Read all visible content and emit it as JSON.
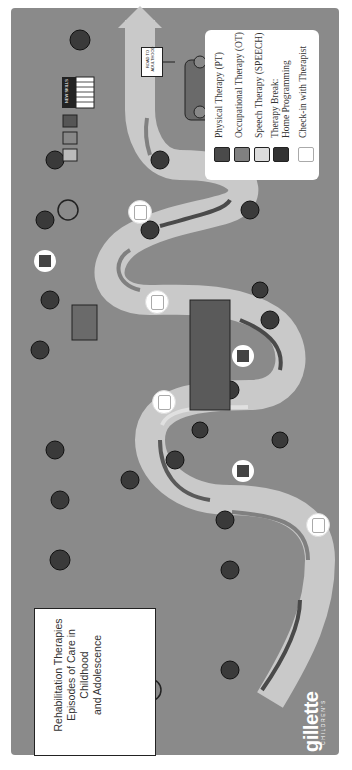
{
  "title": {
    "line1": "Rehabilitation Therapies",
    "line2": "Episodes of Care in Childhood",
    "line3": "and Adolescence"
  },
  "legend": {
    "items": [
      {
        "label": "Physical Therapy (PT)",
        "swatch": "#4a4a4a",
        "icon": "pt-square-icon"
      },
      {
        "label": "Occupational Therapy (OT)",
        "swatch": "#808080",
        "icon": "ot-square-icon"
      },
      {
        "label": "Speech Therapy (SPEECH)",
        "swatch": "#dcdcdc",
        "icon": "speech-square-icon"
      },
      {
        "label": "Therapy Break:",
        "label2": "Home Programming",
        "icon": "house-icon"
      },
      {
        "label": "Check-in with Therapist",
        "icon": "tablet-icon"
      }
    ]
  },
  "signs": {
    "road": "ROAD TO ADULTHOOD",
    "skills": "NEW SKILLS"
  },
  "brand": {
    "name": "gillette",
    "sub": "CHILDREN'S"
  },
  "colors": {
    "background": "#8a8a8a",
    "road": "#d0d0d0",
    "pt": "#4a4a4a",
    "ot": "#808080",
    "speech": "#dcdcdc"
  }
}
